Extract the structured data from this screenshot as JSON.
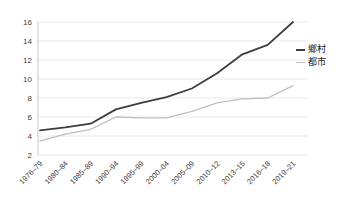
{
  "chart_data": {
    "type": "line",
    "title": "",
    "xlabel": "",
    "ylabel": "",
    "categories": [
      "1976–79",
      "1980–84",
      "1985–89",
      "1990–94",
      "1995–99",
      "2000–04",
      "2005–09",
      "2010–12",
      "2013–15",
      "2016–18",
      "2019–21"
    ],
    "series": [
      {
        "name": "鄉村",
        "color": "#3d3d3d",
        "values": [
          4.6,
          4.9,
          5.3,
          6.8,
          7.5,
          8.1,
          9.0,
          10.6,
          12.6,
          13.6,
          16.0
        ]
      },
      {
        "name": "都市",
        "color": "#bfbfbf",
        "values": [
          3.5,
          4.2,
          4.7,
          6.0,
          5.9,
          5.9,
          6.6,
          7.5,
          7.9,
          8.0,
          9.3
        ]
      }
    ],
    "ylim": [
      2,
      16
    ],
    "yticks": [
      2,
      4,
      6,
      8,
      10,
      12,
      14,
      16
    ],
    "grid": "horizontal",
    "legend_position": "right",
    "grid_color": "#e9e9e9",
    "axis_color": "#c9c9c9",
    "text_color": "#404040"
  }
}
